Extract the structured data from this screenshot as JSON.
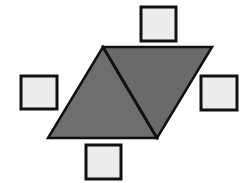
{
  "diagram": {
    "colors": {
      "background": "#ffffff",
      "triangle_fill": "#6e6e6e",
      "square_fill": "#ececec",
      "stroke": "#111111"
    },
    "parallelogram": {
      "vertices": [
        [
          103,
          47
        ],
        [
          212,
          47
        ],
        [
          157,
          138
        ],
        [
          48,
          138
        ]
      ],
      "diagonal": [
        [
          103,
          47
        ],
        [
          157,
          138
        ]
      ]
    },
    "squares": [
      {
        "name": "top",
        "x": 141,
        "y": 7,
        "w": 35,
        "h": 34
      },
      {
        "name": "left",
        "x": 21,
        "y": 76,
        "w": 36,
        "h": 33
      },
      {
        "name": "right",
        "x": 201,
        "y": 76,
        "w": 36,
        "h": 34
      },
      {
        "name": "bottom",
        "x": 86,
        "y": 145,
        "w": 35,
        "h": 34
      }
    ]
  }
}
